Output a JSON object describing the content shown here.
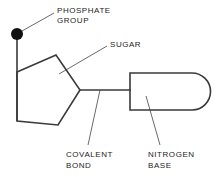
{
  "diagram": {
    "background_color": "#ffffff",
    "stroke_color": "#3a3a3a",
    "leader_color": "#6a6a6a",
    "text_color": "#1c1c1c",
    "labels": {
      "phosphate": {
        "line1": "PHOSPHATE",
        "line2": "GROUP"
      },
      "sugar": {
        "line1": "SUGAR"
      },
      "covalent": {
        "line1": "COVALENT",
        "line2": "BOND"
      },
      "nitrogen": {
        "line1": "NITROGEN",
        "line2": "BASE"
      }
    },
    "parts": {
      "phosphate_dot": {
        "name": "phosphate-group-dot",
        "cx": 17,
        "cy": 34,
        "r": 6,
        "fill": "#111111"
      },
      "phosphate_stem": {
        "name": "phosphate-to-sugar-bond",
        "x1": 17,
        "y1": 40,
        "x2": 17,
        "y2": 121
      },
      "sugar_ring": {
        "name": "sugar-pentagon",
        "points": "17,72 56,55 80,90 58,125 17,121"
      },
      "covalent_bond_line": {
        "name": "covalent-bond-line",
        "x1": 80,
        "y1": 90,
        "x2": 130,
        "y2": 90
      },
      "nitrogen_base": {
        "name": "nitrogen-base-shape",
        "x": 130,
        "y": 73,
        "width": 81,
        "height": 37,
        "radius": 18.5
      }
    },
    "leaders": {
      "phosphate": {
        "x1": 22,
        "y1": 31,
        "x2": 54,
        "y2": 13
      },
      "sugar": {
        "x1": 59,
        "y1": 74,
        "x2": 107,
        "y2": 46
      },
      "covalent": {
        "x1": 100,
        "y1": 90,
        "x2": 88,
        "y2": 145
      },
      "nitrogen": {
        "x1": 146,
        "y1": 96,
        "x2": 160,
        "y2": 145
      }
    }
  }
}
